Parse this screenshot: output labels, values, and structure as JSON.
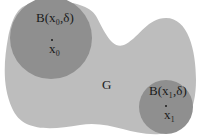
{
  "diagram": {
    "region_label": "G",
    "ball0": {
      "label": "B(x₀,δ)",
      "center_label": "x₀"
    },
    "ball1": {
      "label": "B(x₁,δ)",
      "center_label": "x₁"
    },
    "colors": {
      "region": "#bdbdbd",
      "ball": "#8f8f8f",
      "text": "#1a1a1a"
    }
  }
}
